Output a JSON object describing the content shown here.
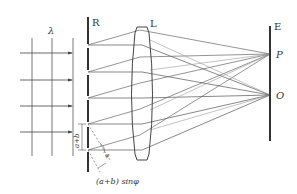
{
  "diagram": {
    "labels": {
      "wavelength": "λ",
      "grating": "R",
      "lens": "L",
      "screen": "E",
      "point_p": "P",
      "point_o": "O",
      "slit_spacing": "a+b",
      "path_difference": "(a+b) sinφ",
      "angle": "φ"
    },
    "colors": {
      "line": "#444444",
      "thick": "#333333",
      "light": "#888888"
    },
    "wavefronts_x": [
      32,
      52,
      73
    ],
    "incident_arrows_y": [
      53,
      80,
      106,
      132
    ],
    "slits_y": [
      45,
      72,
      98,
      124,
      150
    ],
    "screen_points": {
      "P": [
        270,
        54
      ],
      "O": [
        270,
        95
      ]
    }
  }
}
